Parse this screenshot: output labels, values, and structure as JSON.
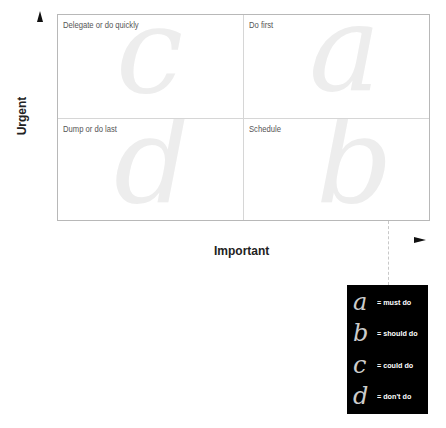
{
  "axes": {
    "y_label": "Urgent",
    "x_label": "Important"
  },
  "quadrants": [
    {
      "id": "top-left",
      "label": "Delegate or do quickly",
      "letter": "c"
    },
    {
      "id": "top-right",
      "label": "Do first",
      "letter": "a"
    },
    {
      "id": "bottom-left",
      "label": "Dump or do last",
      "letter": "d"
    },
    {
      "id": "bottom-right",
      "label": "Schedule",
      "letter": "b"
    }
  ],
  "legend": [
    {
      "letter": "a",
      "text": "= must do"
    },
    {
      "letter": "b",
      "text": "= should do"
    },
    {
      "letter": "c",
      "text": "= could do"
    },
    {
      "letter": "d",
      "text": "= don't do"
    }
  ],
  "colors": {
    "grid_border": "#b8b8b8",
    "grid_divider": "#d6d6d6",
    "big_letter": "#ededed",
    "legend_bg": "#000000",
    "legend_letter": "#cccccc",
    "legend_text": "#ffffff"
  }
}
